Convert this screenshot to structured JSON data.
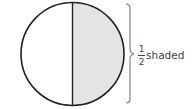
{
  "diagram": {
    "shape": "circle",
    "parts": 2,
    "shaded_parts": 1,
    "shaded_side": "right",
    "colors": {
      "stroke": "#222222",
      "shaded_fill": "#e4e4e4",
      "unshaded_fill": "#ffffff",
      "brace": "#777777"
    },
    "label": {
      "numerator": "1",
      "denominator": "2",
      "text": "shaded"
    }
  }
}
